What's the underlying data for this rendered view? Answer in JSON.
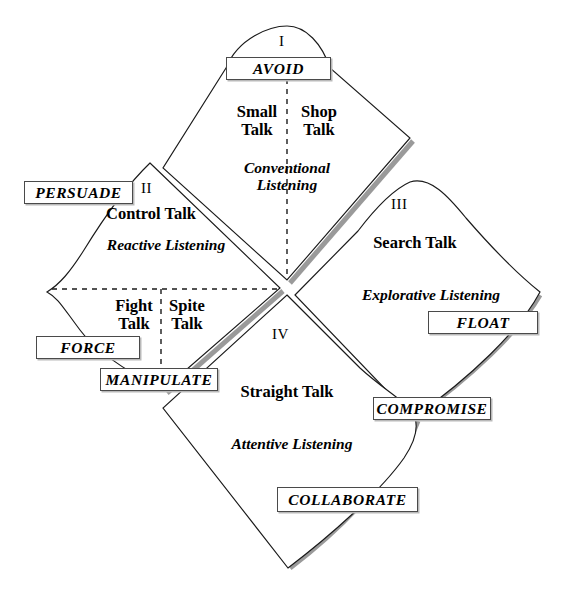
{
  "diagram": {
    "title_absent": true,
    "quadrants": [
      {
        "numeral": "I",
        "cap_label": "AVOID",
        "talk_left": "Small\nTalk",
        "talk_left_line1": "Small",
        "talk_left_line2": "Talk",
        "talk_right_line1": "Shop",
        "talk_right_line2": "Talk",
        "listening_line1": "Conventional",
        "listening_line2": "Listening"
      },
      {
        "numeral": "II",
        "cap_label": "PERSUADE",
        "talk_top": "Control Talk",
        "listening": "Reactive Listening",
        "talk_left_line1": "Fight",
        "talk_left_line2": "Talk",
        "talk_right_line1": "Spite",
        "talk_right_line2": "Talk",
        "sub_label_left": "FORCE",
        "sub_label_bottom": "MANIPULATE"
      },
      {
        "numeral": "III",
        "talk": "Search Talk",
        "listening": "Explorative Listening",
        "cap_label": "FLOAT",
        "sub_label_bottom": "COMPROMISE"
      },
      {
        "numeral": "IV",
        "talk": "Straight Talk",
        "listening": "Attentive Listening",
        "cap_label": "COLLABORATE"
      }
    ],
    "colors": {
      "stroke": "#1a1a1a",
      "box_border": "#4a4a4a",
      "shadow": "#9a9a9a",
      "background": "#ffffff",
      "dash": "#1a1a1a"
    }
  }
}
